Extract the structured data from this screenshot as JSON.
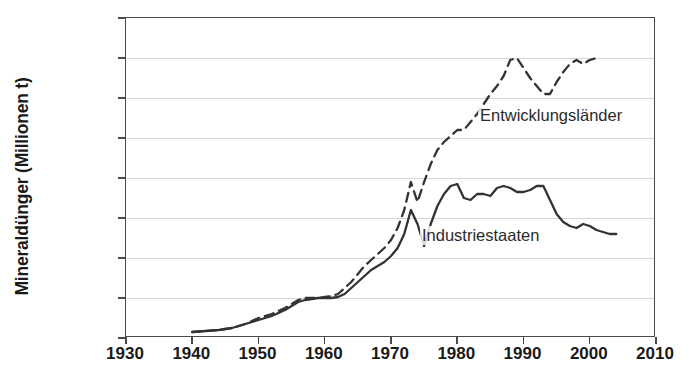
{
  "chart_data": {
    "type": "line",
    "title": "",
    "xlabel": "",
    "ylabel": "Mineraldünger (Millionen t)",
    "xlim": [
      1930,
      2010
    ],
    "ylim": [
      0,
      160
    ],
    "xticks": [
      1930,
      1940,
      1950,
      1960,
      1970,
      1980,
      1990,
      2000,
      2010
    ],
    "yticks": [
      0,
      20,
      40,
      60,
      80,
      100,
      120,
      140,
      160
    ],
    "grid": "horizontal",
    "legend_position": "inline-annotation",
    "series": [
      {
        "name": "Industriestaaten",
        "style": "solid",
        "color": "#333333",
        "label_x": 1988,
        "label_y": 52,
        "points": [
          [
            1940,
            3
          ],
          [
            1942,
            3.5
          ],
          [
            1944,
            4
          ],
          [
            1946,
            5
          ],
          [
            1948,
            7
          ],
          [
            1950,
            9
          ],
          [
            1952,
            11
          ],
          [
            1954,
            14
          ],
          [
            1955,
            16
          ],
          [
            1956,
            18
          ],
          [
            1957,
            19
          ],
          [
            1958,
            19.5
          ],
          [
            1959,
            20
          ],
          [
            1960,
            20
          ],
          [
            1961,
            20
          ],
          [
            1962,
            20.5
          ],
          [
            1963,
            22
          ],
          [
            1964,
            25
          ],
          [
            1965,
            28
          ],
          [
            1966,
            31
          ],
          [
            1967,
            34
          ],
          [
            1968,
            36
          ],
          [
            1969,
            38
          ],
          [
            1970,
            41
          ],
          [
            1971,
            45
          ],
          [
            1972,
            52
          ],
          [
            1973,
            64
          ],
          [
            1974,
            57
          ],
          [
            1975,
            46
          ],
          [
            1976,
            57
          ],
          [
            1977,
            66
          ],
          [
            1978,
            72
          ],
          [
            1979,
            76
          ],
          [
            1980,
            77
          ],
          [
            1981,
            70
          ],
          [
            1982,
            69
          ],
          [
            1983,
            72
          ],
          [
            1984,
            72
          ],
          [
            1985,
            71
          ],
          [
            1986,
            75
          ],
          [
            1987,
            76
          ],
          [
            1988,
            75
          ],
          [
            1989,
            73
          ],
          [
            1990,
            73
          ],
          [
            1991,
            74
          ],
          [
            1992,
            76
          ],
          [
            1993,
            76
          ],
          [
            1994,
            69
          ],
          [
            1995,
            62
          ],
          [
            1996,
            58
          ],
          [
            1997,
            56
          ],
          [
            1998,
            55
          ],
          [
            1999,
            57
          ],
          [
            2000,
            56
          ],
          [
            2001,
            54
          ],
          [
            2002,
            53
          ],
          [
            2003,
            52
          ],
          [
            2004,
            52
          ]
        ]
      },
      {
        "name": "Entwicklungsländer",
        "style": "dashed",
        "color": "#333333",
        "label_x": 1983,
        "label_y": 116,
        "points": [
          [
            1940,
            3
          ],
          [
            1942,
            3.5
          ],
          [
            1944,
            4
          ],
          [
            1946,
            5
          ],
          [
            1948,
            7
          ],
          [
            1950,
            10
          ],
          [
            1952,
            12
          ],
          [
            1954,
            15
          ],
          [
            1955,
            17
          ],
          [
            1956,
            19
          ],
          [
            1957,
            20
          ],
          [
            1958,
            20
          ],
          [
            1959,
            20
          ],
          [
            1960,
            20.5
          ],
          [
            1961,
            21
          ],
          [
            1962,
            22
          ],
          [
            1963,
            25
          ],
          [
            1964,
            28
          ],
          [
            1965,
            32
          ],
          [
            1966,
            36
          ],
          [
            1967,
            39
          ],
          [
            1968,
            42
          ],
          [
            1969,
            45
          ],
          [
            1970,
            49
          ],
          [
            1971,
            55
          ],
          [
            1972,
            64
          ],
          [
            1973,
            78
          ],
          [
            1974,
            68
          ],
          [
            1975,
            78
          ],
          [
            1976,
            87
          ],
          [
            1977,
            94
          ],
          [
            1978,
            98
          ],
          [
            1979,
            101
          ],
          [
            1980,
            104
          ],
          [
            1981,
            104
          ],
          [
            1982,
            108
          ],
          [
            1983,
            112
          ],
          [
            1984,
            117
          ],
          [
            1985,
            122
          ],
          [
            1986,
            126
          ],
          [
            1987,
            131
          ],
          [
            1988,
            139
          ],
          [
            1989,
            140
          ],
          [
            1990,
            135
          ],
          [
            1991,
            130
          ],
          [
            1992,
            126
          ],
          [
            1993,
            122
          ],
          [
            1994,
            122
          ],
          [
            1995,
            128
          ],
          [
            1996,
            133
          ],
          [
            1997,
            137
          ],
          [
            1998,
            139
          ],
          [
            1999,
            137
          ],
          [
            2000,
            139
          ],
          [
            2001,
            140
          ]
        ]
      }
    ]
  }
}
